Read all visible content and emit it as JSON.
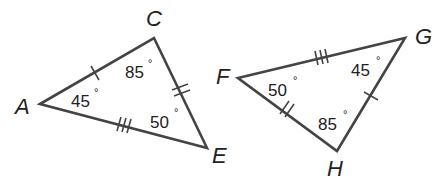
{
  "triangles": [
    {
      "name": "ACE",
      "vertices": {
        "A": {
          "label": "A",
          "angle": "45",
          "degree": "°"
        },
        "C": {
          "label": "C",
          "angle": "85",
          "degree": "°"
        },
        "E": {
          "label": "E",
          "angle": "50",
          "degree": "°"
        }
      },
      "sides": {
        "AC": {
          "tick_marks": 1
        },
        "CE": {
          "tick_marks": 2
        },
        "AE": {
          "tick_marks": 3
        }
      }
    },
    {
      "name": "FGH",
      "vertices": {
        "F": {
          "label": "F",
          "angle": "50",
          "degree": "°"
        },
        "G": {
          "label": "G",
          "angle": "45",
          "degree": "°"
        },
        "H": {
          "label": "H",
          "angle": "85",
          "degree": "°"
        }
      },
      "sides": {
        "GH": {
          "tick_marks": 1
        },
        "FH": {
          "tick_marks": 2
        },
        "FG": {
          "tick_marks": 3
        }
      }
    }
  ],
  "colors": {
    "stroke": "#444444",
    "text": "#222222",
    "background": "#ffffff"
  }
}
